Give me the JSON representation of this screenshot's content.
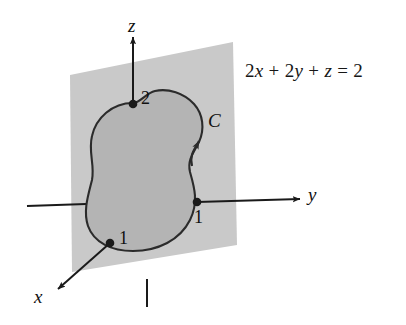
{
  "figure": {
    "plane_equation": {
      "full": "2x + 2y + z = 2",
      "term_1_coeff": "2",
      "term_1_var": "x",
      "plus_1": "+",
      "term_2_coeff": "2",
      "term_2_var": "y",
      "plus_2": "+",
      "term_3_var": "z",
      "equals": "=",
      "rhs": "2"
    },
    "axes": [
      {
        "name": "z-axis",
        "label": "z",
        "direction": "up"
      },
      {
        "name": "y-axis",
        "label": "y",
        "direction": "right"
      },
      {
        "name": "x-axis",
        "label": "x",
        "direction": "down-left"
      }
    ],
    "intercepts": [
      {
        "axis": "z",
        "label": "2",
        "value": 2
      },
      {
        "axis": "y",
        "label": "1",
        "value": 1
      },
      {
        "axis": "x",
        "label": "1",
        "value": 1
      }
    ],
    "curve": {
      "label": "C",
      "closed": true,
      "orientation": "counterclockwise",
      "arrow_direction": "up"
    },
    "colors": {
      "plane_fill": "#c9c9c9",
      "region_fill": "#b4b4b4",
      "curve_stroke": "#2b2b2b",
      "axis_stroke": "#1a1a1a",
      "text": "#111111",
      "background": "#ffffff"
    }
  }
}
